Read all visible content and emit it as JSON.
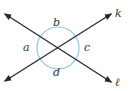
{
  "diagram": {
    "type": "intersecting-lines-angles",
    "intersection": {
      "x": 58,
      "y": 48
    },
    "circle": {
      "cx": 58,
      "cy": 48,
      "r": 21,
      "color": "#8cc8e8"
    },
    "line_color": "#2a2a2a",
    "lines": [
      {
        "name": "k",
        "x1": 5,
        "y1": 81,
        "x2": 111,
        "y2": 14,
        "label": "k",
        "label_x": 115,
        "label_y": 17
      },
      {
        "name": "l",
        "x1": 5,
        "y1": 14,
        "x2": 111,
        "y2": 82,
        "label": "ℓ",
        "label_x": 115,
        "label_y": 86
      }
    ],
    "angles": [
      {
        "label": "a",
        "x": 23,
        "y": 51
      },
      {
        "label": "b",
        "x": 53,
        "y": 26
      },
      {
        "label": "c",
        "x": 84,
        "y": 51
      },
      {
        "label": "d",
        "x": 53,
        "y": 76
      }
    ]
  }
}
